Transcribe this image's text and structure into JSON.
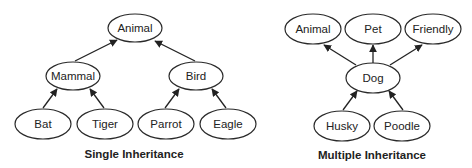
{
  "single": {
    "caption": "Single Inheritance",
    "nodes": {
      "animal": "Animal",
      "mammal": "Mammal",
      "bird": "Bird",
      "bat": "Bat",
      "tiger": "Tiger",
      "parrot": "Parrot",
      "eagle": "Eagle"
    },
    "edges": [
      [
        "mammal",
        "animal"
      ],
      [
        "bird",
        "animal"
      ],
      [
        "bat",
        "mammal"
      ],
      [
        "tiger",
        "mammal"
      ],
      [
        "parrot",
        "bird"
      ],
      [
        "eagle",
        "bird"
      ]
    ]
  },
  "multiple": {
    "caption": "Multiple Inheritance",
    "nodes": {
      "animal": "Animal",
      "pet": "Pet",
      "friendly": "Friendly",
      "dog": "Dog",
      "husky": "Husky",
      "poodle": "Poodle"
    },
    "edges": [
      [
        "dog",
        "animal"
      ],
      [
        "dog",
        "pet"
      ],
      [
        "dog",
        "friendly"
      ],
      [
        "husky",
        "dog"
      ],
      [
        "poodle",
        "dog"
      ]
    ]
  },
  "colors": {
    "stroke": "#2a2a2a",
    "text": "#222222",
    "background": "#ffffff"
  }
}
